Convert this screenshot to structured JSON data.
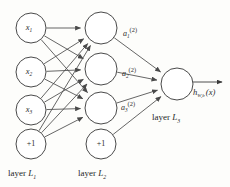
{
  "diagram": {
    "type": "neural-network",
    "stroke_color": "#4a4a4a",
    "text_color": "#2b2b2b",
    "background": "#fdfdfb"
  },
  "layers": [
    {
      "id": "L1",
      "label_prefix": "layer",
      "label_symbol": "L",
      "label_subscript": "1",
      "label_full": "layer L1",
      "nodes": [
        {
          "name": "input-1",
          "symbol": "x",
          "subscript": "1",
          "text": "x1",
          "cx": 31,
          "cy": 28,
          "r": 15,
          "italic": true
        },
        {
          "name": "input-2",
          "symbol": "x",
          "subscript": "2",
          "text": "x2",
          "cx": 31,
          "cy": 72,
          "r": 15,
          "italic": true
        },
        {
          "name": "input-3",
          "symbol": "x",
          "subscript": "3",
          "text": "x3",
          "cx": 31,
          "cy": 110,
          "r": 15,
          "italic": true
        },
        {
          "name": "bias-1",
          "symbol": "+1",
          "subscript": "",
          "text": "+1",
          "cx": 31,
          "cy": 144,
          "r": 15,
          "italic": false
        }
      ]
    },
    {
      "id": "L2",
      "label_prefix": "layer",
      "label_symbol": "L",
      "label_subscript": "2",
      "label_full": "layer L2",
      "nodes": [
        {
          "name": "hidden-1",
          "symbol": "",
          "subscript": "",
          "text": "",
          "cx": 101,
          "cy": 28,
          "r": 16,
          "italic": false
        },
        {
          "name": "hidden-2",
          "symbol": "",
          "subscript": "",
          "text": "",
          "cx": 101,
          "cy": 69,
          "r": 16,
          "italic": false
        },
        {
          "name": "hidden-3",
          "symbol": "",
          "subscript": "",
          "text": "",
          "cx": 101,
          "cy": 108,
          "r": 16,
          "italic": false
        },
        {
          "name": "bias-2",
          "symbol": "+1",
          "subscript": "",
          "text": "+1",
          "cx": 101,
          "cy": 144,
          "r": 15,
          "italic": false
        }
      ]
    },
    {
      "id": "L3",
      "label_prefix": "layer",
      "label_symbol": "L",
      "label_subscript": "3",
      "label_full": "layer L3",
      "nodes": [
        {
          "name": "output-1",
          "symbol": "",
          "subscript": "",
          "text": "",
          "cx": 177,
          "cy": 84,
          "r": 16,
          "italic": false
        }
      ]
    }
  ],
  "activations": [
    {
      "name": "activation-a1",
      "symbol": "a",
      "subscript": "1",
      "superscript": "(2)",
      "text": "a1(2)",
      "x": 123,
      "y": 36
    },
    {
      "name": "activation-a2",
      "symbol": "a",
      "subscript": "2",
      "superscript": "(2)",
      "text": "a2(2)",
      "x": 122,
      "y": 76
    },
    {
      "name": "activation-a3",
      "symbol": "a",
      "subscript": "3",
      "superscript": "(2)",
      "text": "a3(2)",
      "x": 121,
      "y": 110
    }
  ],
  "output": {
    "name": "hypothesis-label",
    "symbol": "h",
    "subscript": "W,b",
    "argument": "(x)",
    "text": "hW,b(x)",
    "x": 193,
    "y": 95,
    "arrow_from_x": 193,
    "arrow_to_x": 224,
    "arrow_y": 82
  },
  "layer_captions": [
    {
      "name": "layer-caption-l1",
      "prefix": "layer",
      "symbol": "L",
      "subscript": "1",
      "x": 8,
      "y": 176
    },
    {
      "name": "layer-caption-l2",
      "prefix": "layer",
      "symbol": "L",
      "subscript": "2",
      "x": 78,
      "y": 176
    },
    {
      "name": "layer-caption-l3",
      "prefix": "layer",
      "symbol": "L",
      "subscript": "3",
      "x": 152,
      "y": 120
    }
  ]
}
